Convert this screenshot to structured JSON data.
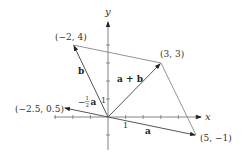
{
  "diagram": {
    "axes": {
      "x_label": "x",
      "y_label": "y",
      "unit_tick_label": "1",
      "x_ticks": [
        -3,
        -2,
        -1,
        1,
        2,
        3,
        4,
        5
      ],
      "y_ticks": [
        -1,
        1,
        2,
        3,
        4
      ]
    },
    "points": [
      {
        "id": "b",
        "label": "(−2, 4)",
        "x": -2,
        "y": 4
      },
      {
        "id": "a_plus_b",
        "label": "(3, 3)",
        "x": 3,
        "y": 3
      },
      {
        "id": "neg_half_a",
        "label": "(−2.5, 0.5)",
        "x": -2.5,
        "y": 0.5
      },
      {
        "id": "a",
        "label": "(5, −1)",
        "x": 5,
        "y": -1
      }
    ],
    "vectors": [
      {
        "id": "a",
        "label": "a",
        "from": [
          0,
          0
        ],
        "to": [
          5,
          -1
        ]
      },
      {
        "id": "b",
        "label": "b",
        "from": [
          0,
          0
        ],
        "to": [
          -2,
          4
        ]
      },
      {
        "id": "a_plus_b",
        "label": "a + b",
        "from": [
          0,
          0
        ],
        "to": [
          3,
          3
        ]
      },
      {
        "id": "neg_half_a",
        "label_prefix": "−",
        "label_frac_num": "1",
        "label_frac_den": "2",
        "label_vec": "a",
        "from": [
          0,
          0
        ],
        "to": [
          -2.5,
          0.5
        ]
      }
    ],
    "parallelogram_edges": [
      {
        "from": [
          -2,
          4
        ],
        "to": [
          3,
          3
        ]
      },
      {
        "from": [
          3,
          3
        ],
        "to": [
          5,
          -1
        ]
      }
    ],
    "colors": {
      "line": "#555555",
      "text": "#333333"
    }
  }
}
